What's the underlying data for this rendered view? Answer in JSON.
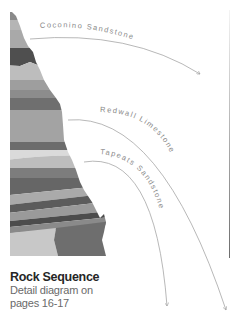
{
  "diagram": {
    "labels": [
      {
        "id": "coconino",
        "text": "Coconino Sandstone"
      },
      {
        "id": "redwall",
        "text": "Redwall Limestone"
      },
      {
        "id": "tapeats",
        "text": "Tapeats Sandstone"
      }
    ],
    "caption": {
      "title": "Rock Sequence",
      "line1": "Detail diagram on",
      "line2": "pages 16-17"
    },
    "colors": {
      "line": "#9a9a9a",
      "label": "#8a8a8a",
      "strata_dark": "#5a5a5a",
      "strata_mid": "#8c8c8c",
      "strata_light": "#c4c4c4"
    }
  }
}
